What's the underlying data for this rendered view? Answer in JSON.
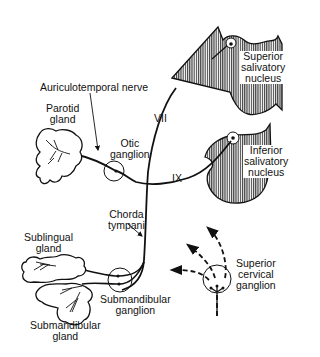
{
  "diagram": {
    "type": "anatomical-pathway",
    "colors": {
      "line": "#111111",
      "hatch": "#222222",
      "background": "#ffffff"
    }
  },
  "labels": {
    "auriculotemporal_nerve": "Auriculotemporal nerve",
    "parotid_gland": [
      "Parotid",
      "gland"
    ],
    "otic_ganglion": [
      "Otic",
      "ganglion"
    ],
    "nerve_vii": "VII",
    "nerve_ix": "IX",
    "superior_salivatory_nucleus": [
      "Superior",
      "salivatory",
      "nucleus"
    ],
    "inferior_salivatory_nucleus": [
      "Inferior",
      "salivatory",
      "nucleus"
    ],
    "chorda_tympani": [
      "Chorda",
      "tympani"
    ],
    "sublingual_gland": [
      "Sublingual",
      "gland"
    ],
    "submandibular_ganglion": [
      "Submandibular",
      "ganglion"
    ],
    "submandibular_gland": [
      "Submandibular",
      "gland"
    ],
    "superior_cervical_ganglion": [
      "Superior",
      "cervical",
      "ganglion"
    ]
  },
  "structures": {
    "brainstem_sections": [
      "superior-salivatory-section",
      "inferior-salivatory-section"
    ],
    "ganglia": [
      "otic",
      "submandibular",
      "superior-cervical"
    ],
    "glands": [
      "parotid",
      "sublingual",
      "submandibular"
    ],
    "nerves": [
      {
        "name": "VII",
        "from": "superior salivatory nucleus",
        "to": "chorda tympani"
      },
      {
        "name": "IX",
        "from": "inferior salivatory nucleus",
        "to": "otic ganglion"
      },
      {
        "name": "Auriculotemporal nerve",
        "from": "otic ganglion",
        "to": "parotid gland"
      },
      {
        "name": "Chorda tympani",
        "from": "VII",
        "to": "submandibular ganglion"
      },
      {
        "name": "sympathetic (dashed)",
        "from": "superior cervical ganglion",
        "to": "glands"
      }
    ]
  }
}
